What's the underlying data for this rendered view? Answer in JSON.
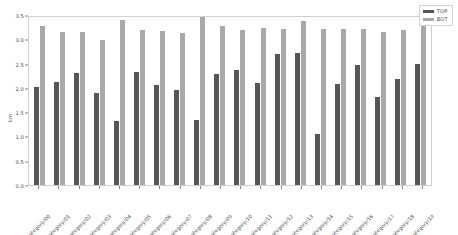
{
  "chart_data": {
    "type": "bar",
    "title": "",
    "xlabel": "",
    "ylabel": "km",
    "ylim": [
      0.0,
      3.5
    ],
    "yticks": [
      "0.0",
      "0.5",
      "1.0",
      "1.5",
      "2.0",
      "2.5",
      "3.0",
      "3.5"
    ],
    "ytick_values": [
      0.0,
      0.5,
      1.0,
      1.5,
      2.0,
      2.5,
      3.0,
      3.5
    ],
    "grid": false,
    "legend_position": "upper right",
    "categories": [
      "category/00",
      "category/01",
      "category/02",
      "category/03",
      "category/04",
      "category/05",
      "category/06",
      "category/07",
      "category/08",
      "category/09",
      "category/10",
      "category/11",
      "category/12",
      "category/13",
      "category/14",
      "category/15",
      "category/16",
      "category/17",
      "category/18",
      "category/19"
    ],
    "series": [
      {
        "name": "TOP",
        "color": "#565656",
        "values": [
          2.02,
          2.13,
          2.31,
          1.89,
          1.32,
          2.33,
          2.05,
          1.95,
          1.34,
          2.29,
          2.37,
          2.1,
          2.69,
          2.71,
          1.06,
          2.07,
          2.47,
          1.82,
          2.18,
          2.5
        ]
      },
      {
        "name": "BOT",
        "color": "#a9a9a9",
        "values": [
          3.27,
          3.15,
          3.15,
          2.99,
          3.4,
          3.19,
          3.18,
          3.14,
          3.46,
          3.28,
          3.2,
          3.23,
          3.22,
          3.37,
          3.21,
          3.21,
          3.22,
          3.16,
          3.19,
          3.31
        ]
      }
    ]
  },
  "legend": {
    "entries": [
      {
        "label": "TOP",
        "color": "#565656"
      },
      {
        "label": "BOT",
        "color": "#a9a9a9"
      }
    ]
  }
}
